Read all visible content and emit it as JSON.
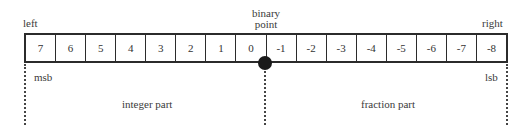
{
  "diagram": {
    "labels": {
      "left": "left",
      "right": "right",
      "binary_point_line1": "binary",
      "binary_point_line2": "point",
      "msb": "msb",
      "lsb": "lsb",
      "integer_part": "integer part",
      "fraction_part": "fraction part"
    },
    "cells": [
      "7",
      "6",
      "5",
      "4",
      "3",
      "2",
      "1",
      "0",
      "-1",
      "-2",
      "-3",
      "-4",
      "-5",
      "-6",
      "-7",
      "-8"
    ],
    "colors": {
      "line": "#2b2b2b",
      "text": "#333333",
      "marker": "#1a1a1a",
      "background": "#ffffff"
    }
  }
}
